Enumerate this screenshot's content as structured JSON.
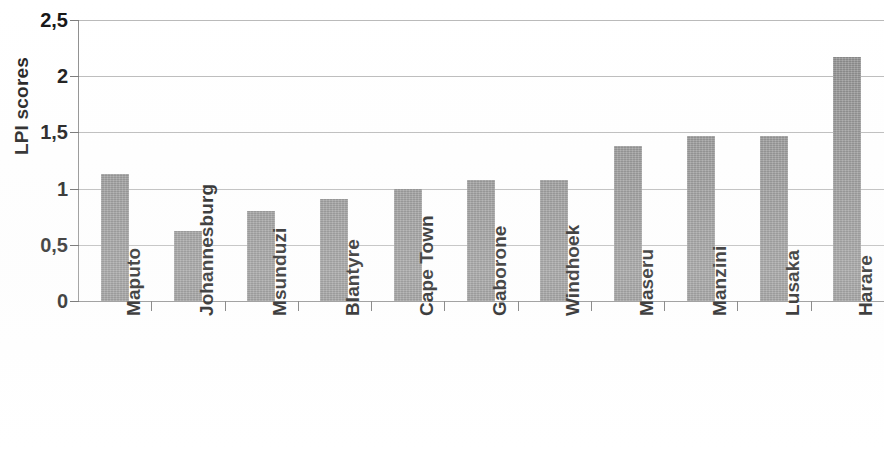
{
  "chart_data": {
    "type": "bar",
    "title": "",
    "subtitle": "",
    "xlabel": "",
    "ylabel": "LPI scores",
    "ylim": [
      0,
      2.5
    ],
    "ytick_labels": [
      "2,5",
      "2",
      "1,5",
      "1",
      "0,5",
      "0"
    ],
    "ytick_values": [
      2.5,
      2.0,
      1.5,
      1.0,
      0.5,
      0
    ],
    "grid": true,
    "legend": "none",
    "decimal_separator": ",",
    "bar_color": "#8e8e8e",
    "categories": [
      "Maputo",
      "Johannesburg",
      "Msunduzi",
      "Blantyre",
      "Cape Town",
      "Gaborone",
      "Windhoek",
      "Maseru",
      "Manzini",
      "Lusaka",
      "Harare"
    ],
    "values": [
      1.13,
      0.62,
      0.8,
      0.91,
      1.0,
      1.08,
      1.08,
      1.38,
      1.47,
      1.47,
      2.17
    ]
  }
}
